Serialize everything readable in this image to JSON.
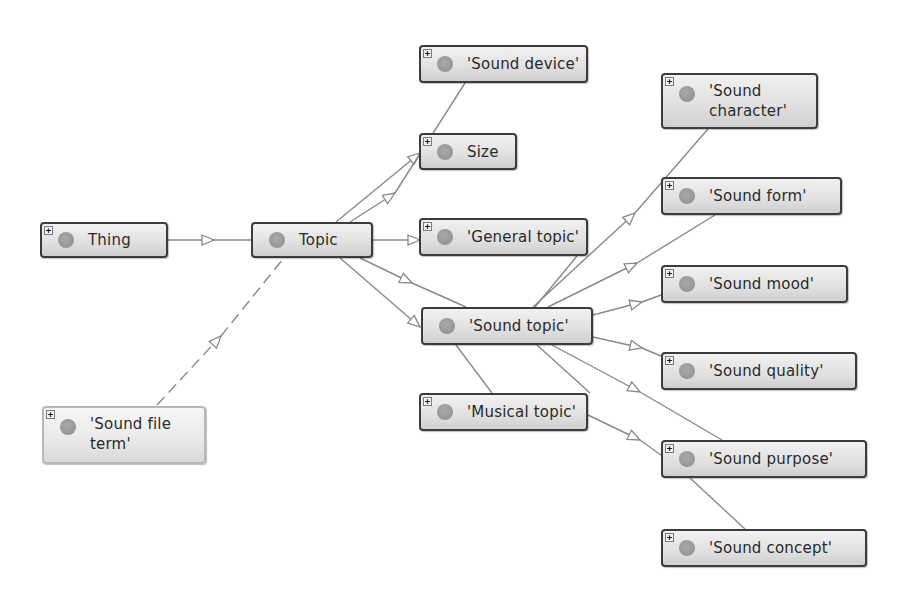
{
  "diagram": {
    "type": "class-hierarchy-graph",
    "nodes": [
      {
        "id": "thing",
        "label": "Thing",
        "expandable": true,
        "expand_glyph": "+"
      },
      {
        "id": "topic",
        "label": "Topic",
        "expandable": false
      },
      {
        "id": "sound_device",
        "label": "'Sound device'",
        "expandable": true,
        "expand_glyph": "+"
      },
      {
        "id": "size",
        "label": "Size",
        "expandable": true,
        "expand_glyph": "+"
      },
      {
        "id": "general_topic",
        "label": "'General topic'",
        "expandable": true,
        "expand_glyph": "+"
      },
      {
        "id": "sound_topic",
        "label": "'Sound topic'",
        "expandable": false
      },
      {
        "id": "musical_topic",
        "label": "'Musical topic'",
        "expandable": true,
        "expand_glyph": "+"
      },
      {
        "id": "sound_file_term",
        "label": "'Sound file\nterm'",
        "expandable": true,
        "expand_glyph": "+"
      },
      {
        "id": "sound_character",
        "label": "'Sound\ncharacter'",
        "expandable": true,
        "expand_glyph": "+"
      },
      {
        "id": "sound_form",
        "label": "'Sound form'",
        "expandable": true,
        "expand_glyph": "+"
      },
      {
        "id": "sound_mood",
        "label": "'Sound mood'",
        "expandable": true,
        "expand_glyph": "+"
      },
      {
        "id": "sound_quality",
        "label": "'Sound quality'",
        "expandable": true,
        "expand_glyph": "+"
      },
      {
        "id": "sound_purpose",
        "label": "'Sound purpose'",
        "expandable": true,
        "expand_glyph": "+"
      },
      {
        "id": "sound_concept",
        "label": "'Sound concept'",
        "expandable": true,
        "expand_glyph": "+"
      }
    ],
    "edges": [
      {
        "from": "thing",
        "to": "topic",
        "style": "solid",
        "arrow": "hollow-triangle"
      },
      {
        "from": "sound_file_term",
        "to": "topic",
        "style": "dashed",
        "arrow": "hollow-triangle"
      },
      {
        "from": "topic",
        "to": "size",
        "style": "solid",
        "arrow": "hollow-triangle"
      },
      {
        "from": "topic",
        "to": "sound_device",
        "style": "solid",
        "arrow": "hollow-triangle"
      },
      {
        "from": "topic",
        "to": "general_topic",
        "style": "solid",
        "arrow": "hollow-triangle"
      },
      {
        "from": "topic",
        "to": "sound_topic",
        "style": "solid",
        "arrow": "hollow-triangle"
      },
      {
        "from": "topic",
        "to": "musical_topic",
        "style": "solid",
        "arrow": "hollow-triangle"
      },
      {
        "from": "sound_topic",
        "to": "sound_character",
        "style": "solid",
        "arrow": "hollow-triangle"
      },
      {
        "from": "sound_topic",
        "to": "sound_form",
        "style": "solid",
        "arrow": "hollow-triangle"
      },
      {
        "from": "sound_topic",
        "to": "sound_mood",
        "style": "solid",
        "arrow": "hollow-triangle"
      },
      {
        "from": "sound_topic",
        "to": "sound_quality",
        "style": "solid",
        "arrow": "hollow-triangle"
      },
      {
        "from": "sound_topic",
        "to": "sound_purpose",
        "style": "solid",
        "arrow": "hollow-triangle"
      },
      {
        "from": "sound_topic",
        "to": "sound_concept",
        "style": "solid",
        "arrow": "hollow-triangle"
      }
    ],
    "colors": {
      "edge": "#8a8a8a",
      "node_border": "#3c3c3c",
      "node_fill_top": "#f1f1f1",
      "node_fill_bottom": "#cfcfcf",
      "node_dot": "#9a9a9a",
      "background": "#ffffff"
    }
  }
}
